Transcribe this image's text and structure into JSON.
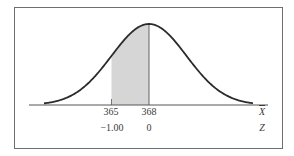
{
  "chart_data": {
    "type": "area",
    "title": "",
    "distribution": "normal",
    "mean": 368,
    "standard_error": 3,
    "shaded_region": {
      "x_from": 365,
      "x_to": 368,
      "z_from": -1.0,
      "z_to": 0
    },
    "axes": [
      {
        "name": "X-bar",
        "label": "X̄",
        "ticks": [
          {
            "value": 365,
            "label": "365"
          },
          {
            "value": 368,
            "label": "368"
          }
        ]
      },
      {
        "name": "Z",
        "label": "Z",
        "ticks": [
          {
            "value": -1.0,
            "label": "−1.00"
          },
          {
            "value": 0,
            "label": "0"
          }
        ]
      }
    ],
    "grid": false,
    "legend": null,
    "colors": {
      "curve": "#2b2b2b",
      "shade": "#d6d6d6",
      "axis": "#555555",
      "frame": "#6f6f6f"
    }
  },
  "labels": {
    "x_tick_1": "365",
    "x_tick_2": "368",
    "z_tick_1": "−1.00",
    "z_tick_2": "0",
    "x_axis_label": "X",
    "z_axis_label": "Z"
  }
}
